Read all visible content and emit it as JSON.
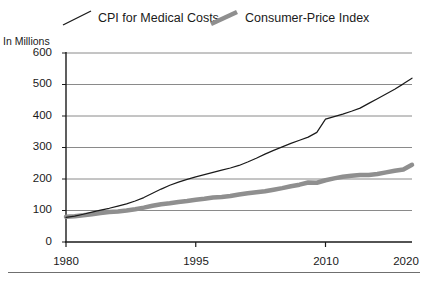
{
  "legend": {
    "items": [
      {
        "label": "CPI for Medical Costs",
        "key": "medical",
        "color": "#1a1a1a",
        "style": "thin-line",
        "swatch_name": "legend-swatch-medical"
      },
      {
        "label": "Consumer-Price Index",
        "key": "cpi",
        "color": "#8f8f8f",
        "style": "thick-line",
        "swatch_name": "legend-swatch-cpi"
      }
    ]
  },
  "axis": {
    "y_title": "In Millions",
    "y_ticks": [
      "600",
      "500",
      "400",
      "300",
      "200",
      "100",
      "0"
    ],
    "x_ticks": [
      "1980",
      "1995",
      "2010",
      "2020"
    ]
  },
  "chart_data": {
    "type": "line",
    "title": "",
    "subtitle": "",
    "xlabel": "",
    "ylabel": "In Millions",
    "xlim": [
      1980,
      2020
    ],
    "ylim": [
      0,
      600
    ],
    "yticks": [
      0,
      100,
      200,
      300,
      400,
      500,
      600
    ],
    "xticks": [
      1980,
      1995,
      2010,
      2020
    ],
    "grid": "horizontal",
    "legend_position": "top",
    "x": [
      1980,
      1981,
      1982,
      1983,
      1984,
      1985,
      1986,
      1987,
      1988,
      1989,
      1990,
      1991,
      1992,
      1993,
      1994,
      1995,
      1996,
      1997,
      1998,
      1999,
      2000,
      2001,
      2002,
      2003,
      2004,
      2005,
      2006,
      2007,
      2008,
      2009,
      2010,
      2011,
      2012,
      2013,
      2014,
      2015,
      2016,
      2017,
      2018,
      2019,
      2020
    ],
    "series": [
      {
        "name": "CPI for Medical Costs",
        "color": "#1a1a1a",
        "width": 1.2,
        "values": [
          78,
          82,
          88,
          95,
          101,
          107,
          114,
          121,
          130,
          141,
          155,
          168,
          180,
          190,
          199,
          207,
          214,
          221,
          228,
          235,
          243,
          254,
          266,
          279,
          291,
          302,
          313,
          323,
          333,
          348,
          390,
          398,
          406,
          415,
          425,
          440,
          455,
          470,
          485,
          502,
          520
        ]
      },
      {
        "name": "Consumer-Price Index",
        "color": "#8f8f8f",
        "width": 4.5,
        "values": [
          80,
          82,
          85,
          88,
          92,
          95,
          97,
          100,
          104,
          109,
          115,
          120,
          123,
          127,
          130,
          134,
          137,
          141,
          143,
          146,
          151,
          155,
          158,
          161,
          166,
          171,
          177,
          182,
          189,
          188,
          196,
          202,
          207,
          210,
          213,
          213,
          216,
          221,
          226,
          230,
          245
        ]
      }
    ]
  }
}
